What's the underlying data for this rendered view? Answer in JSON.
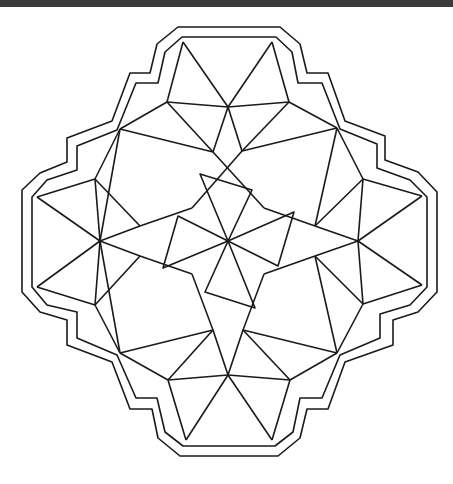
{
  "topbar": {
    "text": "",
    "color": "#3a3a3a"
  },
  "drawing": {
    "stroke": "#1a1a1a",
    "stroke_width": 1.6,
    "outer_border": [
      [
        178,
        27
      ],
      [
        280,
        27
      ],
      [
        300,
        44
      ],
      [
        307,
        73
      ],
      [
        328,
        73
      ],
      [
        345,
        121
      ],
      [
        385,
        136
      ],
      [
        385,
        160
      ],
      [
        418,
        172
      ],
      [
        437,
        192
      ],
      [
        437,
        292
      ],
      [
        418,
        312
      ],
      [
        393,
        320
      ],
      [
        393,
        345
      ],
      [
        345,
        362
      ],
      [
        328,
        409
      ],
      [
        307,
        409
      ],
      [
        300,
        438
      ],
      [
        278,
        456
      ],
      [
        180,
        456
      ],
      [
        158,
        438
      ],
      [
        152,
        409
      ],
      [
        130,
        409
      ],
      [
        112,
        362
      ],
      [
        67,
        345
      ],
      [
        67,
        320
      ],
      [
        40,
        312
      ],
      [
        22,
        292
      ],
      [
        22,
        190
      ],
      [
        40,
        173
      ],
      [
        67,
        162
      ],
      [
        67,
        138
      ],
      [
        112,
        121
      ],
      [
        130,
        73
      ],
      [
        150,
        73
      ],
      [
        157,
        44
      ]
    ],
    "inner_border": [
      [
        182,
        37
      ],
      [
        276,
        37
      ],
      [
        292,
        52
      ],
      [
        298,
        83
      ],
      [
        322,
        83
      ],
      [
        340,
        129
      ],
      [
        377,
        144
      ],
      [
        377,
        168
      ],
      [
        410,
        180
      ],
      [
        427,
        197
      ],
      [
        427,
        287
      ],
      [
        410,
        305
      ],
      [
        380,
        314
      ],
      [
        380,
        338
      ],
      [
        340,
        355
      ],
      [
        322,
        398
      ],
      [
        300,
        398
      ],
      [
        293,
        432
      ],
      [
        275,
        446
      ],
      [
        183,
        446
      ],
      [
        165,
        432
      ],
      [
        157,
        398
      ],
      [
        136,
        398
      ],
      [
        117,
        355
      ],
      [
        77,
        338
      ],
      [
        77,
        312
      ],
      [
        47,
        305
      ],
      [
        32,
        287
      ],
      [
        32,
        197
      ],
      [
        47,
        180
      ],
      [
        77,
        170
      ],
      [
        77,
        146
      ],
      [
        117,
        130
      ],
      [
        136,
        83
      ],
      [
        158,
        83
      ],
      [
        165,
        52
      ]
    ],
    "segments": [
      [
        [
          183,
          42
        ],
        [
          167,
          102
        ]
      ],
      [
        [
          183,
          42
        ],
        [
          228,
          107
        ]
      ],
      [
        [
          272,
          42
        ],
        [
          228,
          107
        ]
      ],
      [
        [
          272,
          42
        ],
        [
          289,
          102
        ]
      ],
      [
        [
          167,
          102
        ],
        [
          228,
          107
        ]
      ],
      [
        [
          228,
          107
        ],
        [
          289,
          102
        ]
      ],
      [
        [
          167,
          102
        ],
        [
          120,
          129
        ]
      ],
      [
        [
          167,
          102
        ],
        [
          213,
          152
        ]
      ],
      [
        [
          120,
          129
        ],
        [
          213,
          152
        ]
      ],
      [
        [
          289,
          102
        ],
        [
          337,
          128
        ]
      ],
      [
        [
          289,
          102
        ],
        [
          242,
          151
        ]
      ],
      [
        [
          337,
          128
        ],
        [
          242,
          151
        ]
      ],
      [
        [
          228,
          107
        ],
        [
          213,
          152
        ]
      ],
      [
        [
          228,
          107
        ],
        [
          242,
          151
        ]
      ],
      [
        [
          120,
          129
        ],
        [
          95,
          179
        ]
      ],
      [
        [
          120,
          129
        ],
        [
          100,
          241
        ]
      ],
      [
        [
          337,
          128
        ],
        [
          363,
          179
        ]
      ],
      [
        [
          337,
          128
        ],
        [
          315,
          226
        ]
      ],
      [
        [
          95,
          179
        ],
        [
          37,
          197
        ]
      ],
      [
        [
          95,
          179
        ],
        [
          100,
          241
        ]
      ],
      [
        [
          37,
          197
        ],
        [
          100,
          241
        ]
      ],
      [
        [
          95,
          179
        ],
        [
          140,
          226
        ]
      ],
      [
        [
          140,
          226
        ],
        [
          100,
          241
        ]
      ],
      [
        [
          363,
          179
        ],
        [
          422,
          196
        ]
      ],
      [
        [
          363,
          179
        ],
        [
          358,
          241
        ]
      ],
      [
        [
          422,
          196
        ],
        [
          358,
          241
        ]
      ],
      [
        [
          315,
          226
        ],
        [
          358,
          241
        ]
      ],
      [
        [
          315,
          226
        ],
        [
          363,
          179
        ]
      ],
      [
        [
          100,
          241
        ],
        [
          37,
          287
        ]
      ],
      [
        [
          37,
          287
        ],
        [
          95,
          305
        ]
      ],
      [
        [
          100,
          241
        ],
        [
          95,
          305
        ]
      ],
      [
        [
          100,
          241
        ],
        [
          140,
          256
        ]
      ],
      [
        [
          140,
          256
        ],
        [
          95,
          305
        ]
      ],
      [
        [
          358,
          241
        ],
        [
          422,
          285
        ]
      ],
      [
        [
          422,
          285
        ],
        [
          363,
          304
        ]
      ],
      [
        [
          358,
          241
        ],
        [
          363,
          304
        ]
      ],
      [
        [
          358,
          241
        ],
        [
          315,
          256
        ]
      ],
      [
        [
          315,
          256
        ],
        [
          363,
          304
        ]
      ],
      [
        [
          95,
          305
        ],
        [
          120,
          353
        ]
      ],
      [
        [
          100,
          241
        ],
        [
          120,
          353
        ]
      ],
      [
        [
          363,
          304
        ],
        [
          337,
          353
        ]
      ],
      [
        [
          315,
          256
        ],
        [
          337,
          353
        ]
      ],
      [
        [
          120,
          353
        ],
        [
          213,
          330
        ]
      ],
      [
        [
          120,
          353
        ],
        [
          168,
          380
        ]
      ],
      [
        [
          213,
          330
        ],
        [
          168,
          380
        ]
      ],
      [
        [
          337,
          353
        ],
        [
          243,
          330
        ]
      ],
      [
        [
          337,
          353
        ],
        [
          290,
          380
        ]
      ],
      [
        [
          243,
          330
        ],
        [
          290,
          380
        ]
      ],
      [
        [
          213,
          330
        ],
        [
          228,
          375
        ]
      ],
      [
        [
          243,
          330
        ],
        [
          228,
          375
        ]
      ],
      [
        [
          168,
          380
        ],
        [
          228,
          375
        ]
      ],
      [
        [
          228,
          375
        ],
        [
          290,
          380
        ]
      ],
      [
        [
          168,
          380
        ],
        [
          186,
          440
        ]
      ],
      [
        [
          228,
          375
        ],
        [
          186,
          440
        ]
      ],
      [
        [
          228,
          375
        ],
        [
          272,
          440
        ]
      ],
      [
        [
          290,
          380
        ],
        [
          272,
          440
        ]
      ],
      [
        [
          213,
          152
        ],
        [
          264,
          208
        ]
      ],
      [
        [
          242,
          151
        ],
        [
          192,
          208
        ]
      ],
      [
        [
          140,
          226
        ],
        [
          192,
          208
        ]
      ],
      [
        [
          140,
          256
        ],
        [
          192,
          274
        ]
      ],
      [
        [
          315,
          226
        ],
        [
          264,
          208
        ]
      ],
      [
        [
          315,
          256
        ],
        [
          264,
          274
        ]
      ],
      [
        [
          213,
          330
        ],
        [
          192,
          274
        ]
      ],
      [
        [
          243,
          330
        ],
        [
          264,
          274
        ]
      ]
    ],
    "pinwheel_center": [
      228,
      241
    ],
    "pinwheel_blades": [
      [
        [
          228,
          241
        ],
        [
          200,
          174
        ],
        [
          252,
          190
        ]
      ],
      [
        [
          228,
          241
        ],
        [
          294,
          212
        ],
        [
          278,
          266
        ]
      ],
      [
        [
          228,
          241
        ],
        [
          255,
          308
        ],
        [
          205,
          292
        ]
      ],
      [
        [
          228,
          241
        ],
        [
          163,
          268
        ],
        [
          178,
          216
        ]
      ]
    ]
  }
}
